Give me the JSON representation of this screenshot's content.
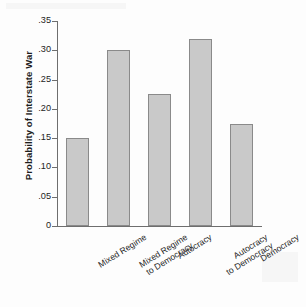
{
  "chart_data": {
    "type": "bar",
    "title": "",
    "xlabel": "",
    "ylabel": "Probability of Interstate War",
    "categories": [
      "Mixed Regime",
      "Mixed Regime\nto Democracy",
      "Autocracy",
      "Autocracy\nto Democracy",
      "Democracy"
    ],
    "values": [
      0.15,
      0.3,
      0.225,
      0.32,
      0.175
    ],
    "ylim": [
      0,
      0.35
    ],
    "ytick_values": [
      0,
      0.05,
      0.1,
      0.15,
      0.2,
      0.25,
      0.3,
      0.35
    ],
    "ytick_labels": [
      "0",
      ".05",
      ".10",
      ".15",
      ".20",
      ".25",
      ".30",
      ".35"
    ],
    "grid": false,
    "legend": null,
    "bar_fill_color": "#c9c9c9",
    "bar_edge_color": "#8a8a8a",
    "axis_color": "#6e6e6e"
  }
}
